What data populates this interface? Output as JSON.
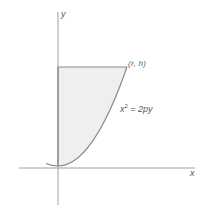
{
  "diagram": {
    "axes": {
      "x_label": "x",
      "y_label": "y"
    },
    "region": {
      "description": "Shaded region bounded by y-axis, line y = h, and parabola x^2 = 2py",
      "fill_color": "#efefef",
      "stroke_color": "#8a8a8a"
    },
    "labels": {
      "point": "(r, h)",
      "equation_lhs": "x",
      "equation_exp": "2",
      "equation_rhs": " = 2py"
    },
    "colors": {
      "axis": "#a0a0a0",
      "curve": "#8a8a8a",
      "text": "#555555"
    }
  }
}
